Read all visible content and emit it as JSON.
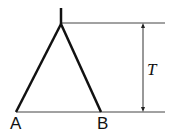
{
  "diagram": {
    "type": "mechanics-figure",
    "labels": {
      "left_base": "A",
      "right_base": "B",
      "height_dimension": "T"
    },
    "geometry": {
      "apex": [
        61,
        24
      ],
      "stub_top": [
        61,
        8
      ],
      "point_a": [
        16,
        112
      ],
      "point_b": [
        101,
        112
      ],
      "top_ref_line": {
        "x1": 61,
        "x2": 165,
        "y": 23
      },
      "base_line": {
        "x1": 16,
        "x2": 165,
        "y": 112
      },
      "dimension_line": {
        "x": 143,
        "y1": 23,
        "y2": 112
      }
    },
    "colors": {
      "stroke": "#111111",
      "thin_line": "#444444",
      "background": "#ffffff"
    }
  }
}
